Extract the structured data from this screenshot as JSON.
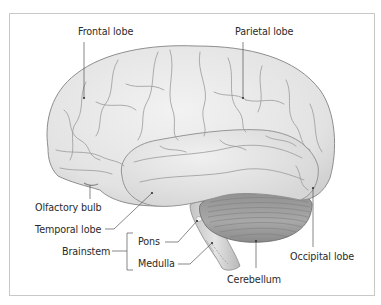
{
  "figure": {
    "type": "labeled anatomical diagram",
    "colors": {
      "frame_border": "#c8c8c8",
      "cerebrum_fill": "#e6e6e6",
      "cerebrum_outline": "#8e8e8e",
      "sulci": "#9a9a9a",
      "cerebellum_fill": "#9e9e9e",
      "brainstem_fill": "#d4d4d4",
      "leader_line": "#555555",
      "label_text": "#2a2a2a"
    }
  },
  "labels": {
    "frontal_lobe": "Frontal lobe",
    "parietal_lobe": "Parietal lobe",
    "olfactory_bulb": "Olfactory bulb",
    "temporal_lobe": "Temporal lobe",
    "brainstem": "Brainstem",
    "pons": "Pons",
    "medulla": "Medulla",
    "cerebellum": "Cerebellum",
    "occipital_lobe": "Occipital lobe"
  }
}
